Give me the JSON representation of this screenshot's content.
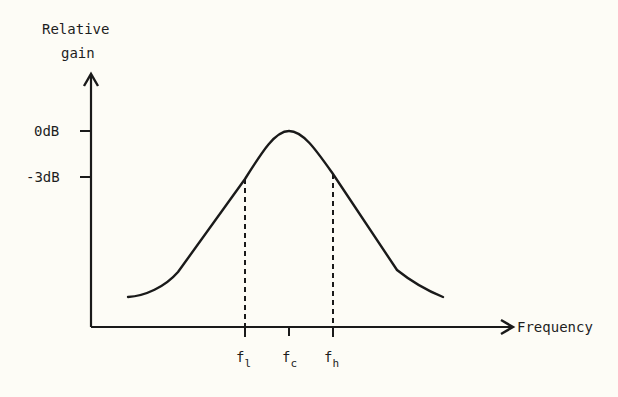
{
  "diagram": {
    "y_axis_label_line1": "Relative",
    "y_axis_label_line2": "gain",
    "x_axis_label": "Frequency",
    "y_ticks": [
      {
        "label": "0dB"
      },
      {
        "label": "-3dB"
      }
    ],
    "x_ticks": [
      {
        "main": "f",
        "sub": "l"
      },
      {
        "main": "f",
        "sub": "c"
      },
      {
        "main": "f",
        "sub": "h"
      }
    ],
    "colors": {
      "background": "#fdfcf6",
      "ink": "#1a1a1a"
    }
  }
}
